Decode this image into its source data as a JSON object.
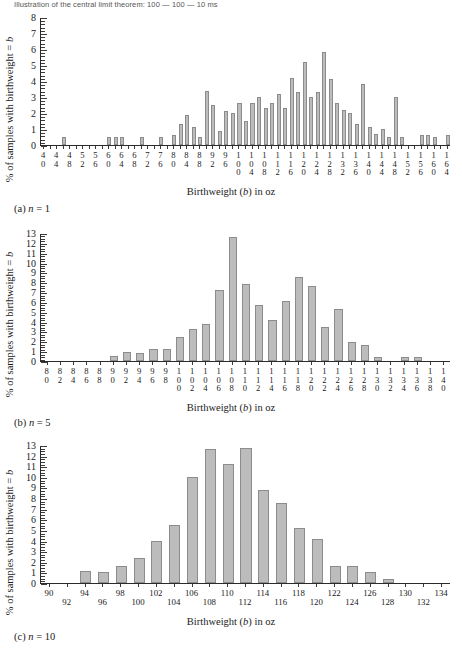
{
  "page_header": "Illustration of the central limit theorem: 100 — 100 — 10 ms",
  "axis_titles": {
    "y": "% of samples with birthweight = b",
    "y_prefix": "% of samples with birthweight = ",
    "y_italic": "b",
    "x_prefix": "Birthweight (",
    "x_italic": "b",
    "x_suffix": ") in oz"
  },
  "captions": {
    "a": {
      "prefix": "(a) ",
      "italic": "n",
      "suffix": " = 1"
    },
    "b": {
      "prefix": "(b) ",
      "italic": "n",
      "suffix": " = 5"
    },
    "c": {
      "prefix": "(c) ",
      "italic": "n",
      "suffix": " = 10"
    }
  },
  "chart_data": [
    {
      "id": "panel-a",
      "type": "bar",
      "title": "(a) n = 1",
      "xlabel": "Birthweight (b) in oz",
      "ylabel": "% of samples with birthweight = b",
      "ylim": [
        0,
        8
      ],
      "yticks": [
        0,
        1,
        2,
        3,
        4,
        5,
        6,
        7,
        8
      ],
      "y_minor_step": 0.2,
      "grid": false,
      "xlim": [
        38,
        166
      ],
      "x_tick_labels": [
        "40",
        "44",
        "48",
        "52",
        "56",
        "60",
        "64",
        "68",
        "72",
        "76",
        "80",
        "84",
        "88",
        "92",
        "96",
        "100",
        "104",
        "108",
        "112",
        "116",
        "120",
        "124",
        "128",
        "132",
        "136",
        "140",
        "144",
        "148",
        "152",
        "156",
        "160",
        "164"
      ],
      "x_label_step": 4,
      "x": [
        40,
        42,
        44,
        46,
        48,
        50,
        52,
        54,
        56,
        58,
        60,
        62,
        64,
        66,
        68,
        70,
        72,
        74,
        76,
        78,
        80,
        82,
        84,
        86,
        88,
        90,
        92,
        94,
        96,
        98,
        100,
        102,
        104,
        106,
        108,
        110,
        112,
        114,
        116,
        118,
        120,
        122,
        124,
        126,
        128,
        130,
        132,
        134,
        136,
        138,
        140,
        142,
        144,
        146,
        148,
        150,
        152,
        154,
        156,
        158,
        160,
        162,
        164
      ],
      "values": [
        0,
        0,
        0,
        0.5,
        0,
        0,
        0,
        0,
        0,
        0,
        0.5,
        0.5,
        0.5,
        0,
        0,
        0.5,
        0,
        0,
        0.5,
        0,
        0.6,
        1.3,
        1.9,
        1.1,
        0.5,
        3.4,
        2.5,
        0.9,
        2.1,
        2.0,
        2.6,
        1.5,
        2.6,
        3.0,
        2.3,
        2.6,
        3.2,
        2.3,
        4.2,
        3.3,
        5.2,
        3.0,
        3.3,
        5.8,
        4.1,
        2.6,
        2.2,
        2.0,
        1.3,
        3.8,
        1.1,
        0.7,
        1.0,
        0.5,
        3.0,
        0.5,
        0,
        0,
        0.6,
        0.6,
        0.5,
        0,
        0.6
      ]
    },
    {
      "id": "panel-b",
      "type": "bar",
      "title": "(b) n = 5",
      "xlabel": "Birthweight (b) in oz",
      "ylabel": "% of samples with birthweight = b",
      "ylim": [
        0,
        13
      ],
      "yticks": [
        0,
        1,
        2,
        3,
        4,
        5,
        6,
        7,
        8,
        9,
        10,
        11,
        12,
        13
      ],
      "y_minor_step": 0.25,
      "grid": false,
      "xlim": [
        79,
        141
      ],
      "x_tick_labels": [
        "80",
        "82",
        "84",
        "86",
        "88",
        "90",
        "92",
        "94",
        "96",
        "98",
        "100",
        "102",
        "104",
        "106",
        "108",
        "110",
        "112",
        "114",
        "116",
        "118",
        "120",
        "122",
        "124",
        "126",
        "128",
        "130",
        "132",
        "134",
        "136",
        "138",
        "140"
      ],
      "x_label_step": 2,
      "x": [
        80,
        82,
        84,
        86,
        88,
        90,
        92,
        94,
        96,
        98,
        100,
        102,
        104,
        106,
        108,
        110,
        112,
        114,
        116,
        118,
        120,
        122,
        124,
        126,
        128,
        130,
        132,
        134,
        136,
        138,
        140
      ],
      "values": [
        0,
        0,
        0,
        0,
        0,
        0.5,
        0.9,
        0.8,
        1.2,
        1.2,
        2.4,
        3.3,
        3.8,
        7.2,
        12.6,
        7.8,
        5.7,
        4.2,
        6.1,
        8.5,
        7.6,
        3.5,
        5.3,
        1.9,
        1.6,
        0.4,
        0,
        0.4,
        0.4,
        0,
        0
      ]
    },
    {
      "id": "panel-c",
      "type": "bar",
      "title": "(c) n = 10",
      "xlabel": "Birthweight (b) in oz",
      "ylabel": "% of samples with birthweight = b",
      "ylim": [
        0,
        13
      ],
      "yticks": [
        0,
        1,
        2,
        3,
        4,
        5,
        6,
        7,
        8,
        9,
        10,
        11,
        12,
        13
      ],
      "y_minor_step": 0.25,
      "grid": false,
      "xlim": [
        89,
        135
      ],
      "x_tick_labels": [
        "90",
        "92",
        "94",
        "96",
        "98",
        "100",
        "102",
        "104",
        "106",
        "108",
        "110",
        "112",
        "114",
        "116",
        "118",
        "120",
        "122",
        "124",
        "126",
        "128",
        "130",
        "132",
        "134"
      ],
      "x_label_step": 2,
      "x": [
        90,
        92,
        94,
        96,
        98,
        100,
        102,
        104,
        106,
        108,
        110,
        112,
        114,
        116,
        118,
        120,
        122,
        124,
        126,
        128,
        130,
        132,
        134
      ],
      "values": [
        0,
        0,
        1.1,
        1.0,
        1.6,
        2.4,
        4.0,
        5.5,
        10.0,
        12.6,
        11.2,
        12.7,
        8.8,
        7.5,
        5.2,
        4.1,
        1.6,
        1.6,
        1.0,
        0.4,
        0,
        0,
        0
      ]
    }
  ],
  "colors": {
    "bar_fill": "#bcbcbc",
    "bar_stroke": "#8c8c8c",
    "axis": "#2b2b2b",
    "text": "#1a1a1a"
  }
}
